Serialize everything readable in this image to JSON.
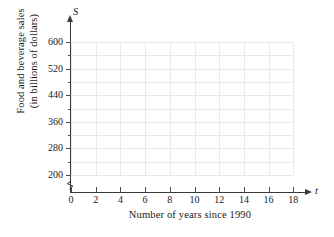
{
  "chart_data": {
    "type": "scatter",
    "title": "",
    "subtitle": "",
    "xlabel": "Number of years since 1990",
    "ylabel": "Food and beverage sales (in billions of dollars)",
    "ylabel_lines": [
      "Food and beverage sales",
      "(in billions of dollars)"
    ],
    "x_axis_variable": "S",
    "y_axis_variable": "t",
    "x_variable_symbol": "t",
    "y_variable_symbol": "S",
    "xlim": [
      0,
      18
    ],
    "ylim": [
      160,
      620
    ],
    "xticks": [
      0,
      2,
      4,
      6,
      8,
      10,
      12,
      14,
      16,
      18
    ],
    "xtick_labels": [
      "0",
      "2",
      "4",
      "6",
      "8",
      "10",
      "12",
      "14",
      "16",
      "18"
    ],
    "yticks": [
      200,
      280,
      360,
      440,
      520,
      600
    ],
    "ytick_labels": [
      "200",
      "280",
      "360",
      "440",
      "520",
      "600"
    ],
    "y_minor_ticks": [
      240,
      320,
      400,
      480,
      560
    ],
    "x_gridlines": [
      0,
      2,
      4,
      6,
      8,
      10,
      12,
      14,
      16,
      18
    ],
    "y_gridlines": [
      200,
      240,
      280,
      320,
      360,
      400,
      440,
      480,
      520,
      560,
      600
    ],
    "grid": true,
    "legend": null,
    "legend_position": "none",
    "series": [],
    "values": [],
    "categories": [],
    "annotations": [],
    "axis_break": true
  },
  "colors": {
    "background": "#ffffff",
    "axis": "#3a3a3a",
    "tick": "#4a4a4a",
    "grid": "#e9e9ec",
    "text": "#1a1a1a"
  }
}
